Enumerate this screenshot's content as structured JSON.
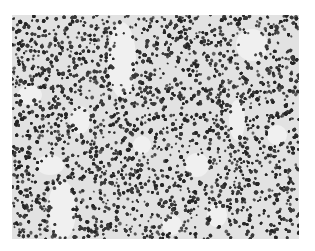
{
  "image": {
    "subject": "histology micrograph of densely packed small dark-stained cells (lymphoid tissue), grayscale",
    "frame": {
      "x": 12,
      "y": 15,
      "width": 287,
      "height": 224
    },
    "colors": {
      "page_background": "#ffffff",
      "tissue_background": "#e2e2e2",
      "cell_nucleus": "#3a3a3a",
      "cell_nucleus_dark": "#262626",
      "void_region": "#f0f0f0"
    },
    "cell_density": 0.55,
    "cell_size_px": [
      2,
      4
    ],
    "void_regions": [
      {
        "cx": 110,
        "cy": 45,
        "rx": 14,
        "ry": 38
      },
      {
        "cx": 68,
        "cy": 105,
        "rx": 10,
        "ry": 14
      },
      {
        "cx": 18,
        "cy": 80,
        "rx": 12,
        "ry": 10
      },
      {
        "cx": 130,
        "cy": 130,
        "rx": 9,
        "ry": 9
      },
      {
        "cx": 185,
        "cy": 150,
        "rx": 12,
        "ry": 12
      },
      {
        "cx": 240,
        "cy": 30,
        "rx": 16,
        "ry": 16
      },
      {
        "cx": 50,
        "cy": 195,
        "rx": 14,
        "ry": 30
      },
      {
        "cx": 225,
        "cy": 105,
        "rx": 8,
        "ry": 20
      },
      {
        "cx": 265,
        "cy": 120,
        "rx": 10,
        "ry": 10
      },
      {
        "cx": 205,
        "cy": 200,
        "rx": 10,
        "ry": 12
      },
      {
        "cx": 160,
        "cy": 210,
        "rx": 10,
        "ry": 10
      },
      {
        "cx": 38,
        "cy": 150,
        "rx": 14,
        "ry": 10
      }
    ]
  }
}
